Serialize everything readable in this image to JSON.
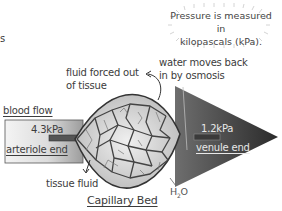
{
  "diagram": {
    "title": "Capillary Bed",
    "left_edge_fragment": "s",
    "note": {
      "line1": "Pressure is measured in",
      "line2": "kilopascals (kPa)."
    },
    "labels": {
      "fluid_out_line1": "fluid forced out",
      "fluid_out_line2": "of tissue",
      "water_back_line1": "water moves back",
      "water_back_line2": "in by osmosis",
      "blood_flow": "blood flow",
      "arteriole_pressure": "4.3kPa",
      "arteriole_end": "arteriole end",
      "venule_pressure": "1.2kPa",
      "venule_end": "venule end",
      "tissue_fluid": "tissue fluid",
      "water_symbol": "H",
      "water_subscript": "2",
      "water_suffix": "O"
    },
    "colors": {
      "arteriole_fill_light": "#f2f2f2",
      "arteriole_fill_dark": "#9a9a9a",
      "venule_fill_light": "#7a7a7a",
      "venule_fill_dark": "#2e2e2e",
      "bed_fill": "#d9d9d9",
      "vessel_stroke": "#3a3a3a",
      "text": "#3c3c3c"
    }
  }
}
